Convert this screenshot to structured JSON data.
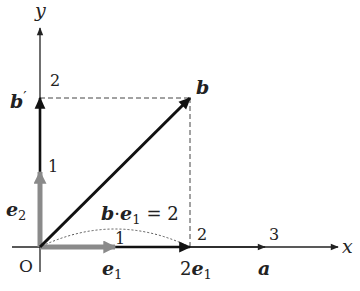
{
  "diagram": {
    "type": "vector projection diagram",
    "origin_label": "O",
    "axes": {
      "x_label": "x",
      "y_label": "y",
      "x_ticks": [
        "1",
        "2",
        "3"
      ],
      "y_ticks": [
        "1",
        "2"
      ]
    },
    "vectors": {
      "e1": {
        "label": "e",
        "subscript": "1",
        "from": [
          0,
          0
        ],
        "to": [
          1,
          0
        ],
        "color": "#8a8a8a"
      },
      "e2": {
        "label": "e",
        "subscript": "2",
        "from": [
          0,
          0
        ],
        "to": [
          0,
          1
        ],
        "color": "#8a8a8a"
      },
      "b": {
        "label": "b",
        "from": [
          0,
          0
        ],
        "to": [
          2,
          2
        ],
        "color": "#111111"
      },
      "b_prime": {
        "label": "b",
        "prime": "′",
        "from": [
          0,
          0
        ],
        "to": [
          0,
          2
        ],
        "color": "#111111"
      },
      "two_e1": {
        "coef": "2",
        "label": "e",
        "subscript": "1",
        "from": [
          0,
          0
        ],
        "to": [
          2,
          0
        ],
        "color": "#111111"
      },
      "a": {
        "label": "a",
        "from": [
          0,
          0
        ],
        "to": [
          3,
          0
        ],
        "color": "#222222"
      }
    },
    "annotation": {
      "lhs_b": "b",
      "dot": "·",
      "lhs_e": "e",
      "lhs_sub": "1",
      "rhs": "= 2"
    },
    "arc_label": "1"
  }
}
